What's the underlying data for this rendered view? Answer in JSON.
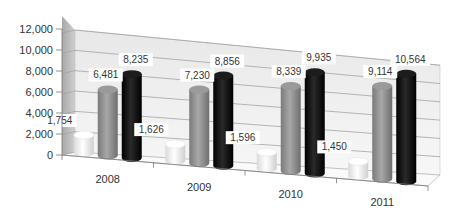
{
  "chart_data": {
    "type": "bar",
    "subtype": "3d-cylinder-clustered",
    "title": "",
    "xlabel": "",
    "ylabel": "",
    "categories": [
      "2008",
      "2009",
      "2010",
      "2011"
    ],
    "series": [
      {
        "name": "Series 1",
        "color": "#f2f2f2",
        "values": [
          1754,
          1626,
          1596,
          1450
        ]
      },
      {
        "name": "Series 2",
        "color": "#8c8c8c",
        "values": [
          6481,
          7230,
          8339,
          9114
        ]
      },
      {
        "name": "Series 3",
        "color": "#111111",
        "values": [
          8235,
          8856,
          9935,
          10564
        ]
      }
    ],
    "data_labels": [
      [
        "1,754",
        "1,626",
        "1,596",
        "1,450"
      ],
      [
        "6,481",
        "7,230",
        "8,339",
        "9,114"
      ],
      [
        "8,235",
        "8,856",
        "9,935",
        "10,564"
      ]
    ],
    "ylim": [
      0,
      12000
    ],
    "yticks": [
      "0",
      "2,000",
      "4,000",
      "6,000",
      "8,000",
      "10,000",
      "12,000"
    ],
    "grid": true,
    "legend": "none"
  }
}
